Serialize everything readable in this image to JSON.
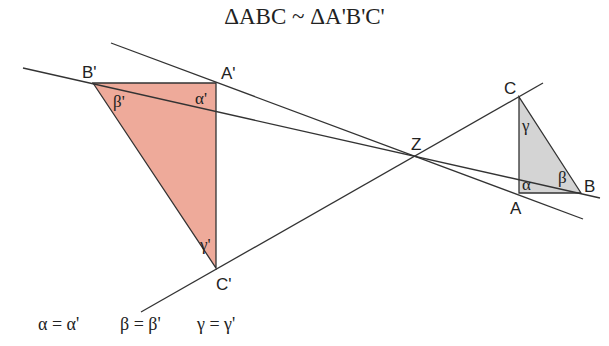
{
  "title": "ΔABC ~ ΔA'B'C'",
  "colors": {
    "large_triangle_fill": "#eeaa9a",
    "small_triangle_fill": "#d4d4d4",
    "line": "#333333"
  },
  "points": {
    "A_prime": {
      "label": "A'",
      "x": 216,
      "y": 83
    },
    "B_prime": {
      "label": "B'",
      "x": 93,
      "y": 83
    },
    "C_prime": {
      "label": "C'",
      "x": 216,
      "y": 268
    },
    "A": {
      "label": "A",
      "x": 519,
      "y": 193
    },
    "B": {
      "label": "B",
      "x": 581,
      "y": 193
    },
    "C": {
      "label": "C",
      "x": 519,
      "y": 97
    },
    "Z": {
      "label": "Z",
      "x": 418,
      "y": 156
    }
  },
  "angles": {
    "alpha_prime": "α'",
    "beta_prime": "β'",
    "gamma_prime": "γ'",
    "alpha": "α",
    "beta": "β",
    "gamma": "γ"
  },
  "equalities": [
    "α = α'",
    "β = β'",
    "γ = γ'"
  ]
}
